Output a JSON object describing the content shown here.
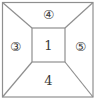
{
  "diagram": {
    "regions": {
      "top": "④",
      "left": "③",
      "center": "1",
      "right": "⑤",
      "bottom": "4"
    },
    "colors": {
      "line": "#8f8f8f",
      "text": "#3c3c3c",
      "background": "#ffffff"
    }
  }
}
